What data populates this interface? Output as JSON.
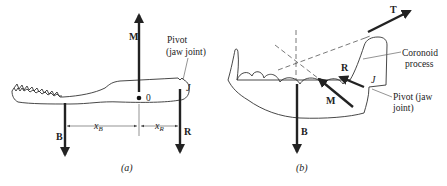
{
  "figure": {
    "panels": [
      {
        "id": "a",
        "caption": "(a)",
        "forces": [
          {
            "symbol": "M",
            "direction": "up"
          },
          {
            "symbol": "B",
            "direction": "down"
          },
          {
            "symbol": "R",
            "direction": "down"
          }
        ],
        "point_label": "0",
        "joint_label": "J",
        "pivot_label_line1": "Pivot",
        "pivot_label_line2": "(jaw joint)",
        "dimension_x_b": "x",
        "dimension_x_b_sub": "B",
        "dimension_x_r": "x",
        "dimension_x_r_sub": "R"
      },
      {
        "id": "b",
        "caption": "(b)",
        "forces": [
          {
            "symbol": "T",
            "direction": "up-right"
          },
          {
            "symbol": "M",
            "direction": "up-left"
          },
          {
            "symbol": "R",
            "direction": "up-left"
          },
          {
            "symbol": "B",
            "direction": "down"
          }
        ],
        "joint_label": "J",
        "coronoid_label_line1": "Coronoid",
        "coronoid_label_line2": "process",
        "pivot_label_line1": "Pivot (jaw",
        "pivot_label_line2": "joint)"
      }
    ]
  }
}
